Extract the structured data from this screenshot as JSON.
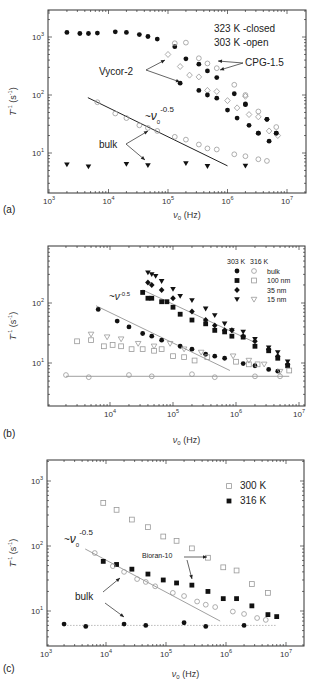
{
  "chart_data": [
    {
      "type": "scatter",
      "panel_label": "(a)",
      "xlabel": "ν0 (Hz)",
      "ylabel": "T1^-1 (s^-1)",
      "xscale": "log",
      "yscale": "log",
      "xlim": [
        1000,
        20000000
      ],
      "ylim": [
        2,
        2900
      ],
      "xticks": [
        {
          "v": 3,
          "label": "10^3"
        },
        {
          "v": 4,
          "label": "10^4"
        },
        {
          "v": 5,
          "label": "10^5"
        },
        {
          "v": 6,
          "label": "10^6"
        },
        {
          "v": 7,
          "label": "10^7"
        }
      ],
      "yticks": [
        {
          "v": 1,
          "label": "10^1"
        },
        {
          "v": 2,
          "label": "10^2"
        },
        {
          "v": 3,
          "label": "10^3"
        }
      ],
      "legend_text": [
        "323 K -closed",
        "303 K -open"
      ],
      "legend_position": "top-right",
      "annotations": [
        {
          "text": "Vycor-2"
        },
        {
          "text": "CPG-1.5"
        },
        {
          "text": "bulk"
        },
        {
          "text": "~ν0^-0.5"
        }
      ],
      "series": [
        {
          "name": "Vycor-2 closed (323 K)",
          "marker": "filled-circle",
          "x": [
            2000,
            3300,
            4600,
            6500,
            13000,
            20000,
            33000,
            46000,
            66000,
            130000,
            200000,
            330000,
            460000,
            660000,
            1000000,
            1450000,
            2000000,
            2300000,
            3300000,
            4600000,
            5000000,
            6600000
          ],
          "y": [
            1200,
            1150,
            1150,
            1170,
            1230,
            1200,
            1100,
            1020,
            920,
            680,
            420,
            340,
            260,
            200,
            55,
            40,
            70,
            30,
            22,
            38,
            16,
            22
          ]
        },
        {
          "name": "Vycor-2 open (303 K)",
          "marker": "open-diamond",
          "x": [
            100000,
            160000,
            230000,
            330000,
            460000,
            660000,
            1000000,
            1450000,
            2000000,
            2300000,
            3300000,
            5000000,
            7000000
          ],
          "y": [
            500,
            310,
            220,
            205,
            120,
            115,
            80,
            60,
            95,
            46,
            42,
            24,
            20
          ]
        },
        {
          "name": "CPG-1.5 closed",
          "marker": "filled-circle",
          "x": [
            160000,
            330000,
            460000,
            660000,
            1300000,
            2000000,
            3300000,
            4600000,
            6600000
          ],
          "y": [
            160,
            120,
            100,
            88,
            105,
            68,
            22,
            38,
            22
          ]
        },
        {
          "name": "CPG-1.5 open",
          "marker": "open-circle",
          "x": [
            130000,
            200000,
            330000,
            460000,
            660000,
            1300000,
            2000000,
            3300000,
            6600000
          ],
          "y": [
            780,
            800,
            430,
            350,
            290,
            150,
            100,
            52,
            28
          ]
        },
        {
          "name": "bulk open",
          "marker": "open-circle",
          "x": [
            6500,
            13000,
            20000,
            33000,
            46000,
            66000,
            130000,
            200000,
            330000,
            460000,
            660000,
            1300000,
            2000000,
            3300000,
            4600000
          ],
          "y": [
            75,
            48,
            40,
            30,
            27,
            24,
            19,
            17,
            14,
            12,
            11.5,
            9.5,
            8.8,
            7.8,
            7.3
          ]
        },
        {
          "name": "bulk closed",
          "marker": "filled-triangle-down",
          "x": [
            2000,
            4600,
            20000,
            46000,
            200000,
            460000,
            2000000
          ],
          "y": [
            6.3,
            5.8,
            6.4,
            6.1,
            6.6,
            5.9,
            6.0
          ]
        }
      ],
      "fit_line": {
        "label": "~ν0^-0.5",
        "x": [
          4500,
          1000000
        ],
        "y": [
          90,
          6
        ]
      }
    },
    {
      "type": "scatter",
      "panel_label": "(b)",
      "xlabel": "ν0 (Hz)",
      "ylabel": "T1^-1 (s^-1)",
      "xscale": "log",
      "yscale": "log",
      "xlim": [
        1200,
        12000000
      ],
      "ylim": [
        1.9,
        1000
      ],
      "xticks": [
        {
          "v": 4,
          "label": "10^4"
        },
        {
          "v": 5,
          "label": "10^5"
        },
        {
          "v": 6,
          "label": "10^6"
        },
        {
          "v": 7,
          "label": "10^7"
        }
      ],
      "yticks": [
        {
          "v": 1,
          "label": "10^1"
        },
        {
          "v": 2,
          "label": "10^2"
        }
      ],
      "legend_title": [
        "303 K",
        "316 K"
      ],
      "legend": [
        {
          "label": "bulk",
          "m303": "filled-circle",
          "m316": "open-circle"
        },
        {
          "label": "100 nm",
          "m303": "filled-square",
          "m316": "open-square"
        },
        {
          "label": "35 nm",
          "m303": "filled-diamond",
          "m316": ""
        },
        {
          "label": "15 nm",
          "m303": "filled-triangle-down",
          "m316": "open-triangle-down"
        }
      ],
      "legend_position": "top-right",
      "annotations": [
        {
          "text": "~ν^-0.5"
        }
      ],
      "series": [
        {
          "name": "bulk 303 K",
          "marker": "filled-circle",
          "x": [
            6500,
            13000,
            20000,
            33000,
            46000,
            66000,
            130000,
            200000,
            330000,
            460000,
            660000,
            1300000,
            2000000,
            3300000,
            4600000
          ],
          "y": [
            78,
            50,
            40,
            31,
            28,
            24,
            19,
            17,
            14,
            13,
            12,
            9.8,
            9,
            7.8,
            7.3
          ]
        },
        {
          "name": "bulk 316 K",
          "marker": "open-circle",
          "x": [
            2000,
            4600,
            20000,
            46000,
            200000,
            460000,
            2000000,
            5000000
          ],
          "y": [
            6.3,
            5.8,
            6.3,
            6.0,
            6.5,
            5.8,
            6.0,
            6.0
          ]
        },
        {
          "name": "100 nm 303 K",
          "marker": "filled-square",
          "x": [
            33000,
            40000,
            46000,
            66000,
            80000,
            100000,
            130000,
            200000,
            330000,
            460000,
            660000,
            860000,
            1300000,
            2000000,
            3300000,
            4600000,
            6600000
          ],
          "y": [
            150,
            120,
            120,
            105,
            105,
            85,
            65,
            52,
            45,
            35,
            33,
            28,
            27,
            19,
            16,
            12,
            9
          ]
        },
        {
          "name": "100 nm 316 K",
          "marker": "open-square",
          "x": [
            3000,
            5000,
            8000,
            11000,
            15000,
            22000,
            33000,
            50000,
            66000,
            100000,
            150000,
            220000,
            350000,
            1000000,
            1600000,
            2200000,
            7000000
          ],
          "y": [
            23,
            24,
            19,
            20,
            19,
            17,
            17,
            16,
            17,
            13,
            12.5,
            11,
            12.5,
            10.5,
            9.5,
            9.5,
            7.5
          ]
        },
        {
          "name": "35 nm 303 K",
          "marker": "filled-diamond",
          "x": [
            40000,
            46000,
            66000,
            100000,
            200000,
            330000,
            460000,
            660000,
            860000,
            1300000,
            2000000,
            3300000,
            4600000,
            6600000
          ],
          "y": [
            220,
            200,
            165,
            120,
            72,
            52,
            42,
            35,
            35,
            28,
            23,
            17,
            13,
            9.5
          ]
        },
        {
          "name": "15 nm 303 K",
          "marker": "filled-triangle-down",
          "x": [
            40000,
            46000,
            53000,
            66000,
            100000,
            130000,
            200000,
            330000,
            460000,
            660000,
            860000,
            1300000,
            2000000,
            3300000,
            4600000,
            6600000
          ],
          "y": [
            320,
            300,
            280,
            230,
            170,
            130,
            110,
            80,
            62,
            45,
            35,
            33,
            25,
            18,
            15,
            10.5
          ]
        },
        {
          "name": "15 nm 316 K",
          "marker": "open-triangle-down",
          "x": [
            5000,
            9000,
            15000,
            28000,
            50000,
            90000,
            150000,
            280000,
            900000,
            1600000,
            2800000,
            5000000
          ],
          "y": [
            30,
            27,
            25,
            21,
            19,
            21,
            17,
            15,
            13,
            11,
            9.5,
            7.2
          ]
        }
      ],
      "fit_lines": [
        {
          "x": [
            6000,
            800000
          ],
          "y": [
            90,
            7.5
          ]
        },
        {
          "x": [
            33000,
            2000000
          ],
          "y": [
            165,
            22
          ]
        },
        {
          "x": [
            2000,
            7000000
          ],
          "y": [
            6,
            6
          ]
        }
      ]
    },
    {
      "type": "scatter",
      "panel_label": "(c)",
      "xlabel": "ν0 (Hz)",
      "ylabel": "T1^-1 (s^-1)",
      "xscale": "log",
      "yscale": "log",
      "xlim": [
        1000,
        20000000
      ],
      "ylim": [
        2.9,
        2000
      ],
      "xticks": [
        {
          "v": 3,
          "label": "10^3"
        },
        {
          "v": 4,
          "label": "10^4"
        },
        {
          "v": 5,
          "label": "10^5"
        },
        {
          "v": 6,
          "label": "10^6"
        },
        {
          "v": 7,
          "label": "10^7"
        }
      ],
      "yticks": [
        {
          "v": 1,
          "label": "10^1"
        },
        {
          "v": 2,
          "label": "10^2"
        },
        {
          "v": 3,
          "label": "10^3"
        }
      ],
      "legend": [
        {
          "label": "300 K",
          "marker": "open-square"
        },
        {
          "label": "316 K",
          "marker": "filled-square"
        }
      ],
      "legend_position": "top-right",
      "annotations": [
        {
          "text": "~ν0^-0.5"
        },
        {
          "text": "Bioran-10"
        },
        {
          "text": "bulk"
        }
      ],
      "series": [
        {
          "name": "Bioran-10 300 K",
          "marker": "open-square",
          "x": [
            9000,
            15000,
            27000,
            50000,
            90000,
            150000,
            270000,
            500000,
            900000,
            1500000,
            2700000,
            5000000
          ],
          "y": [
            460,
            360,
            255,
            195,
            140,
            120,
            92,
            66,
            47,
            42,
            26,
            19
          ]
        },
        {
          "name": "Bioran-10 316 K",
          "marker": "filled-square",
          "x": [
            9000,
            15000,
            27000,
            50000,
            90000,
            150000,
            270000,
            500000,
            900000,
            1500000,
            2700000,
            5000000,
            7000000
          ],
          "y": [
            58,
            52,
            44,
            37,
            30,
            27,
            25,
            20,
            15.5,
            15.5,
            12,
            8.8,
            8.2
          ]
        },
        {
          "name": "bulk 300 K",
          "marker": "open-circle",
          "x": [
            6500,
            13000,
            20000,
            33000,
            46000,
            66000,
            130000,
            200000,
            330000,
            460000,
            660000,
            1300000,
            2000000,
            3300000,
            4600000
          ],
          "y": [
            78,
            49,
            40,
            31,
            28,
            24,
            19,
            17,
            14,
            12.5,
            11.5,
            9.8,
            9,
            7.8,
            7.3
          ]
        },
        {
          "name": "bulk 316 K",
          "marker": "filled-circle",
          "x": [
            2000,
            4600,
            20000,
            46000,
            200000,
            460000,
            2000000
          ],
          "y": [
            6.3,
            5.8,
            6.3,
            6.0,
            6.6,
            5.8,
            6.0
          ]
        }
      ],
      "fit_lines": [
        {
          "x": [
            4500,
            800000
          ],
          "y": [
            90,
            7
          ]
        },
        {
          "x": [
            2000,
            7000000
          ],
          "y": [
            6,
            6
          ],
          "dotted": true
        }
      ]
    }
  ]
}
